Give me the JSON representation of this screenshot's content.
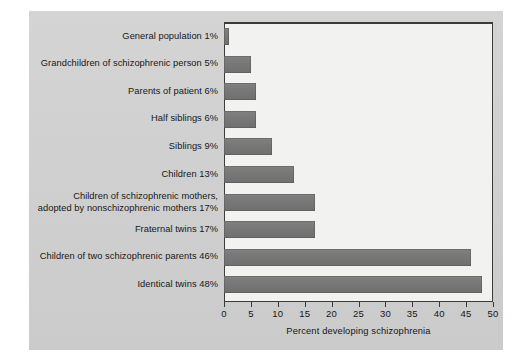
{
  "chart_data": {
    "type": "bar",
    "orientation": "horizontal",
    "title": "",
    "xlabel": "Percent developing schizophrenia",
    "ylabel": "",
    "xlim": [
      0,
      50
    ],
    "xticks": [
      0,
      5,
      10,
      15,
      20,
      25,
      30,
      35,
      40,
      45,
      50
    ],
    "grid": false,
    "legend": false,
    "bar_color": "#787878",
    "panel_color": "#d2d2d2",
    "plot_bg_color": "#f2f2f0",
    "categories": [
      "General population",
      "Grandchildren of schizophrenic person",
      "Parents of patient",
      "Half siblings",
      "Siblings",
      "Children",
      "Children of schizophrenic mothers, adopted by nonschizophrenic mothers",
      "Fraternal twins",
      "Children of two schizophrenic parents",
      "Identical twins"
    ],
    "values": [
      1,
      5,
      6,
      6,
      9,
      13,
      17,
      17,
      46,
      48
    ],
    "labels": [
      "General population 1%",
      "Grandchildren of schizophrenic person 5%",
      "Parents of patient 6%",
      "Half siblings 6%",
      "Siblings 9%",
      "Children 13%",
      "Children of schizophrenic mothers,\nadopted by nonschizophrenic mothers 17%",
      "Fraternal twins 17%",
      "Children of two schizophrenic parents 46%",
      "Identical twins 48%"
    ]
  }
}
